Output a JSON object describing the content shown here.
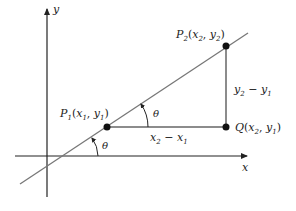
{
  "diagram": {
    "type": "slope-triangle",
    "axes": {
      "x_label": "x",
      "y_label": "y"
    },
    "points": {
      "p1": {
        "name": "P",
        "sub": "1",
        "coords": [
          "x",
          "1",
          "y",
          "1"
        ]
      },
      "p2": {
        "name": "P",
        "sub": "2",
        "coords": [
          "x",
          "2",
          "y",
          "2"
        ]
      },
      "q": {
        "name": "Q",
        "coords": [
          "x",
          "2",
          "y",
          "1"
        ]
      }
    },
    "segments": {
      "horizontal": {
        "a": "x",
        "a_sub": "2",
        "op": "−",
        "b": "x",
        "b_sub": "1"
      },
      "vertical": {
        "a": "y",
        "a_sub": "2",
        "op": "−",
        "b": "y",
        "b_sub": "1"
      }
    },
    "angles": {
      "at_p1": "θ",
      "at_x_axis": "θ"
    },
    "colors": {
      "axis": "#222222",
      "line": "#777777",
      "triangle": "#666666",
      "point": "#111111"
    }
  }
}
